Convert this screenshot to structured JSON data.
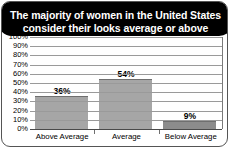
{
  "title": {
    "line1": "The majority of women in the United States",
    "line2": "consider their looks average or above"
  },
  "chart_data": {
    "type": "bar",
    "title": "The majority of women in the United States consider their looks average or above",
    "categories": [
      "Above Average",
      "Average",
      "Below Average"
    ],
    "values": [
      36,
      54,
      9
    ],
    "data_labels": [
      "36%",
      "54%",
      "9%"
    ],
    "xlabel": "",
    "ylabel": "",
    "ylim": [
      0,
      100
    ],
    "ytick_step": 10,
    "ytick_labels": [
      "100%",
      "90%",
      "80%",
      "70%",
      "60%",
      "50%",
      "40%",
      "30%",
      "20%",
      "10%",
      "0%"
    ],
    "grid": true,
    "legend": false,
    "colors": {
      "bar_light": "#a6a6a6",
      "bar_dark": "#8c8c8c",
      "gridline": "#9a9a9a",
      "title_background": "#000000",
      "title_text": "#ffffff",
      "frame_border": "#555555"
    }
  }
}
